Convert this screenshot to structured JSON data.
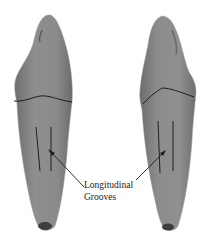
{
  "figure": {
    "annotation": {
      "line1": "Longitudinal",
      "line2": "Grooves"
    },
    "colors": {
      "background": "#ffffff",
      "tooth_fill": "#8a8a8a",
      "tooth_shadow": "#5e5e5e",
      "line": "#1e1e1e"
    }
  }
}
